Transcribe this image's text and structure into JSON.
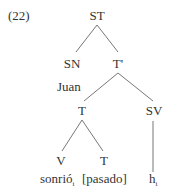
{
  "example_number": "(22)",
  "tree": {
    "root": "ST",
    "sn": "SN",
    "sn_word": "Juan",
    "tbar": "T'",
    "t": "T",
    "sv": "SV",
    "v": "V",
    "t_head": "T",
    "v_word": "sonrió",
    "v_index": "i",
    "t_word": "[pasado]",
    "trace": "h",
    "trace_index": "i"
  },
  "colors": {
    "line": "#666666",
    "text": "#333333"
  }
}
